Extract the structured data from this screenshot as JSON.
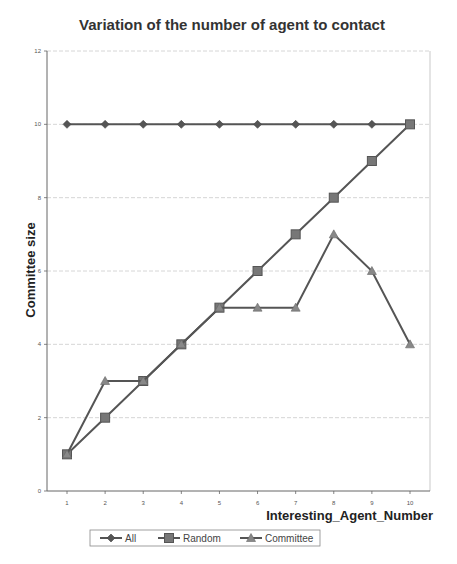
{
  "chart_data": {
    "type": "line",
    "title": "Variation of the number of agent to contact",
    "xlabel": "Interesting_Agent_Number",
    "ylabel": "Committee size",
    "x": [
      1,
      2,
      3,
      4,
      5,
      6,
      7,
      8,
      9,
      10
    ],
    "xticks": [
      "1",
      "2",
      "3",
      "4",
      "5",
      "6",
      "7",
      "8",
      "9",
      "10"
    ],
    "ylim": [
      0,
      12
    ],
    "yticks": [
      "0",
      "2",
      "4",
      "6",
      "8",
      "10",
      "12"
    ],
    "grid": true,
    "legend_position": "bottom",
    "series": [
      {
        "name": "All",
        "marker": "diamond",
        "values": [
          10,
          10,
          10,
          10,
          10,
          10,
          10,
          10,
          10,
          10
        ]
      },
      {
        "name": "Random",
        "marker": "square",
        "values": [
          1,
          2,
          3,
          4,
          5,
          6,
          7,
          8,
          9,
          10
        ]
      },
      {
        "name": "Committee",
        "marker": "triangle",
        "values": [
          1,
          3,
          3,
          4,
          5,
          5,
          5,
          7,
          6,
          4
        ]
      }
    ],
    "colors": {
      "line": "#555555",
      "marker": "#666666",
      "grid": "#cccccc",
      "axis": "#666666"
    }
  }
}
